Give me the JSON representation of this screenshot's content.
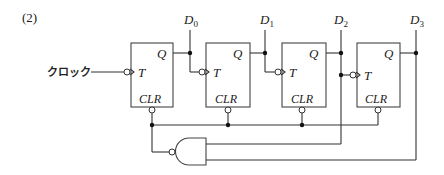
{
  "problem_label": "(2)",
  "clock_label": "クロック",
  "flip_flops": [
    {
      "id": "ff0",
      "q_label": "Q",
      "t_label": "T",
      "clr_label": "CLR",
      "output": {
        "base": "D",
        "sub": "0"
      }
    },
    {
      "id": "ff1",
      "q_label": "Q",
      "t_label": "T",
      "clr_label": "CLR",
      "output": {
        "base": "D",
        "sub": "1"
      }
    },
    {
      "id": "ff2",
      "q_label": "Q",
      "t_label": "T",
      "clr_label": "CLR",
      "output": {
        "base": "D",
        "sub": "2"
      }
    },
    {
      "id": "ff3",
      "q_label": "Q",
      "t_label": "T",
      "clr_label": "CLR",
      "output": {
        "base": "D",
        "sub": "3"
      }
    }
  ],
  "gate": {
    "type": "NAND",
    "inputs": [
      "D2",
      "D3"
    ],
    "output": "CLR (all flip-flops)"
  },
  "colors": {
    "line": "#333333",
    "background": "#ffffff"
  }
}
